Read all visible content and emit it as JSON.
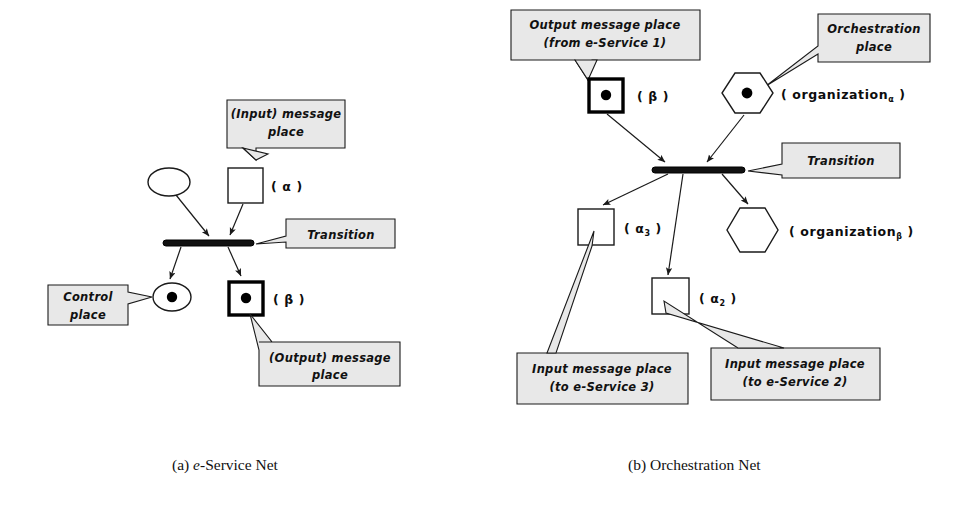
{
  "figure": {
    "panels": [
      {
        "id": "panel-a",
        "caption_prefix": "(a)",
        "caption_em": "e",
        "caption_rest": "-Service Net",
        "callouts": [
          {
            "name": "input-message-place",
            "lines": [
              "(Input) message",
              "place"
            ]
          },
          {
            "name": "transition",
            "lines": [
              "Transition"
            ]
          },
          {
            "name": "control-place",
            "lines": [
              "Control",
              "place"
            ]
          },
          {
            "name": "output-message-place",
            "lines": [
              "(Output) message",
              "place"
            ]
          }
        ],
        "labels": [
          {
            "name": "alpha-label",
            "text": "( α )",
            "sub": ""
          },
          {
            "name": "beta-label",
            "text": "( β )",
            "sub": ""
          }
        ],
        "nodes": [
          {
            "name": "control-place-empty",
            "kind": "ellipse",
            "tokens": 0
          },
          {
            "name": "input-message-place-square",
            "kind": "square",
            "tokens": 0
          },
          {
            "name": "transition-bar",
            "kind": "transition"
          },
          {
            "name": "control-place-marked",
            "kind": "ellipse",
            "tokens": 1
          },
          {
            "name": "output-message-place-square",
            "kind": "square-thick",
            "tokens": 1
          }
        ]
      },
      {
        "id": "panel-b",
        "caption_prefix": "(b)",
        "caption_em": "",
        "caption_rest": "Orchestration Net",
        "callouts": [
          {
            "name": "output-message-place",
            "lines": [
              "Output message place",
              "(from e-Service 1)"
            ]
          },
          {
            "name": "orchestration-place",
            "lines": [
              "Orchestration",
              "place"
            ]
          },
          {
            "name": "transition",
            "lines": [
              "Transition"
            ]
          },
          {
            "name": "input-message-place-service3",
            "lines": [
              "Input message place",
              "(to e-Service 3)"
            ]
          },
          {
            "name": "input-message-place-service2",
            "lines": [
              "Input message place",
              "(to e-Service 2)"
            ]
          }
        ],
        "labels": [
          {
            "name": "beta-label",
            "text": "( β )",
            "sub": ""
          },
          {
            "name": "organization-alpha-label",
            "text": "( organization",
            "sub": "α",
            "suffix": " )"
          },
          {
            "name": "organization-beta-label",
            "text": "( organization",
            "sub": "β",
            "suffix": " )"
          },
          {
            "name": "alpha3-label",
            "text": "( α",
            "sub": "3",
            "suffix": " )"
          },
          {
            "name": "alpha2-label",
            "text": "( α",
            "sub": "2",
            "suffix": " )"
          }
        ],
        "nodes": [
          {
            "name": "output-message-place-square",
            "kind": "square-thick",
            "tokens": 1
          },
          {
            "name": "orchestration-place-hexagon",
            "kind": "hexagon",
            "tokens": 1
          },
          {
            "name": "transition-bar",
            "kind": "transition"
          },
          {
            "name": "input-message-place-square-alpha3",
            "kind": "square",
            "tokens": 0
          },
          {
            "name": "input-message-place-square-alpha2",
            "kind": "square",
            "tokens": 0
          },
          {
            "name": "organization-beta-hexagon",
            "kind": "hexagon",
            "tokens": 0
          }
        ]
      }
    ],
    "colors": {
      "callout_fill": "#e8e8e8",
      "stroke": "#1a1a1a",
      "token": "#000000",
      "background": "#ffffff"
    }
  }
}
